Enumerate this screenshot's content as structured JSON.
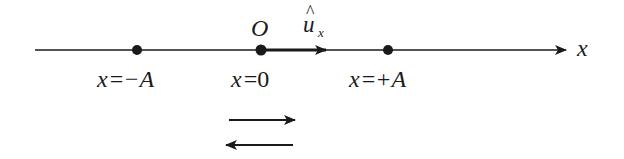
{
  "axis": {
    "label": "x",
    "origin_label": "O",
    "unit_vector_label": "u",
    "unit_vector_hat": "^",
    "unit_vector_subscript": "x"
  },
  "points": [
    {
      "name": "minus-A",
      "var": "x",
      "eq": "=",
      "value": "−A"
    },
    {
      "name": "zero",
      "var": "x",
      "eq": "=",
      "value": "0"
    },
    {
      "name": "plus-A",
      "var": "x",
      "eq": "=",
      "value": "+A"
    }
  ],
  "colors": {
    "ink": "#1a1a1a",
    "background": "#ffffff"
  }
}
